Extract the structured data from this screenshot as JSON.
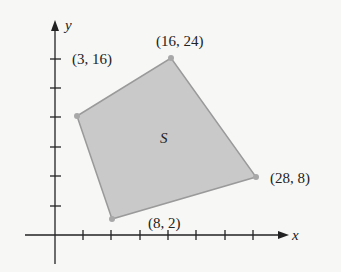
{
  "diagram": {
    "region_label": "S",
    "axes": {
      "x_label": "x",
      "y_label": "y"
    },
    "vertices": [
      {
        "label": "(3, 16)",
        "x": 3,
        "y": 16
      },
      {
        "label": "(16, 24)",
        "x": 16,
        "y": 24
      },
      {
        "label": "(28, 8)",
        "x": 28,
        "y": 8
      },
      {
        "label": "(8, 2)",
        "x": 8,
        "y": 2
      }
    ],
    "colors": {
      "region_fill": "#c9c9c9",
      "region_stroke": "#9a9a9a",
      "vertex_dot": "#a8a8a8",
      "axis": "#222222",
      "background": "#f7f7f6"
    }
  }
}
